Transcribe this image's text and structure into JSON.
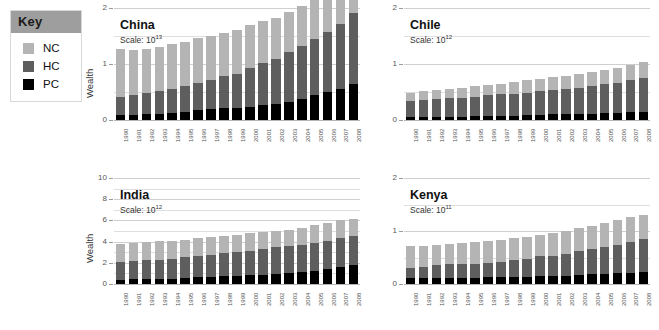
{
  "key": {
    "title": "Key",
    "items": [
      {
        "label": "NC",
        "color": "#b4b4b4"
      },
      {
        "label": "HC",
        "color": "#5e5e5e"
      },
      {
        "label": "PC",
        "color": "#000000"
      }
    ]
  },
  "colors": {
    "nc": "#b4b4b4",
    "hc": "#5e5e5e",
    "pc": "#000000",
    "grid": "#cfcfcf",
    "text": "#1a1a1a",
    "key_header_bg": "#9e9e9e"
  },
  "axis": {
    "ylabel": "Wealth",
    "scale_prefix": "Scale:",
    "scale_base": "10"
  },
  "years": [
    "1990",
    "1991",
    "1992",
    "1993",
    "1994",
    "1995",
    "1996",
    "1997",
    "1998",
    "1999",
    "2000",
    "2001",
    "2002",
    "2003",
    "2004",
    "2005",
    "2006",
    "2007",
    "2008"
  ],
  "chart_data": [
    {
      "type": "bar",
      "subtype": "stacked",
      "title": "China",
      "scale_exponent": "13",
      "xlabel": "",
      "ylabel": "Wealth",
      "ylim": [
        0,
        2
      ],
      "yticks": [
        0,
        1,
        2
      ],
      "grid": true,
      "legend": [
        "NC",
        "HC",
        "PC"
      ],
      "legend_position": "outside-top-left",
      "categories": [
        "1990",
        "1991",
        "1992",
        "1993",
        "1994",
        "1995",
        "1996",
        "1997",
        "1998",
        "1999",
        "2000",
        "2001",
        "2002",
        "2003",
        "2004",
        "2005",
        "2006",
        "2007",
        "2008"
      ],
      "series": [
        {
          "name": "PC",
          "values": [
            0.09,
            0.09,
            0.1,
            0.11,
            0.13,
            0.15,
            0.17,
            0.19,
            0.21,
            0.22,
            0.24,
            0.27,
            0.29,
            0.33,
            0.37,
            0.44,
            0.5,
            0.56,
            0.64
          ]
        },
        {
          "name": "HC",
          "values": [
            0.32,
            0.35,
            0.38,
            0.4,
            0.42,
            0.45,
            0.49,
            0.53,
            0.57,
            0.61,
            0.68,
            0.75,
            0.8,
            0.89,
            0.95,
            1.0,
            1.07,
            1.15,
            1.27
          ]
        },
        {
          "name": "NC",
          "values": [
            0.85,
            0.81,
            0.79,
            0.79,
            0.8,
            0.8,
            0.8,
            0.78,
            0.78,
            0.78,
            0.77,
            0.74,
            0.74,
            0.71,
            0.71,
            0.7,
            0.69,
            0.68,
            0.67
          ]
        }
      ],
      "totals": [
        1.26,
        1.25,
        1.27,
        1.3,
        1.35,
        1.4,
        1.46,
        1.5,
        1.56,
        1.61,
        1.69,
        1.76,
        1.83,
        1.93,
        2.03,
        2.14,
        2.26,
        2.39,
        2.58
      ]
    },
    {
      "type": "bar",
      "subtype": "stacked",
      "title": "Chile",
      "scale_exponent": "12",
      "xlabel": "",
      "ylabel": "",
      "ylim": [
        0,
        2
      ],
      "yticks": [
        0,
        1,
        2
      ],
      "grid": true,
      "legend": [
        "NC",
        "HC",
        "PC"
      ],
      "categories": [
        "1990",
        "1991",
        "1992",
        "1993",
        "1994",
        "1995",
        "1996",
        "1997",
        "1998",
        "1999",
        "2000",
        "2001",
        "2002",
        "2003",
        "2004",
        "2005",
        "2006",
        "2007",
        "2008"
      ],
      "series": [
        {
          "name": "PC",
          "values": [
            0.05,
            0.05,
            0.06,
            0.06,
            0.06,
            0.07,
            0.07,
            0.08,
            0.08,
            0.09,
            0.09,
            0.1,
            0.1,
            0.11,
            0.11,
            0.12,
            0.12,
            0.14,
            0.15
          ]
        },
        {
          "name": "HC",
          "values": [
            0.29,
            0.3,
            0.31,
            0.33,
            0.34,
            0.35,
            0.37,
            0.38,
            0.39,
            0.4,
            0.42,
            0.43,
            0.45,
            0.47,
            0.49,
            0.52,
            0.54,
            0.57,
            0.6
          ]
        },
        {
          "name": "NC",
          "values": [
            0.15,
            0.16,
            0.16,
            0.17,
            0.18,
            0.18,
            0.19,
            0.19,
            0.21,
            0.22,
            0.22,
            0.23,
            0.24,
            0.25,
            0.26,
            0.26,
            0.27,
            0.28,
            0.29
          ]
        }
      ],
      "totals": [
        0.49,
        0.51,
        0.53,
        0.56,
        0.58,
        0.6,
        0.63,
        0.65,
        0.68,
        0.71,
        0.73,
        0.76,
        0.79,
        0.83,
        0.86,
        0.9,
        0.93,
        0.99,
        1.04
      ]
    },
    {
      "type": "bar",
      "subtype": "stacked",
      "title": "India",
      "scale_exponent": "12",
      "xlabel": "",
      "ylabel": "Wealth",
      "ylim": [
        0,
        10
      ],
      "yticks": [
        0,
        2,
        4,
        6,
        8,
        10
      ],
      "grid": true,
      "legend": [
        "NC",
        "HC",
        "PC"
      ],
      "categories": [
        "1990",
        "1991",
        "1992",
        "1993",
        "1994",
        "1995",
        "1996",
        "1997",
        "1998",
        "1999",
        "2000",
        "2001",
        "2002",
        "2003",
        "2004",
        "2005",
        "2006",
        "2007",
        "2008"
      ],
      "series": [
        {
          "name": "PC",
          "values": [
            0.42,
            0.44,
            0.46,
            0.48,
            0.52,
            0.56,
            0.62,
            0.68,
            0.72,
            0.76,
            0.82,
            0.88,
            0.95,
            1.05,
            1.15,
            1.27,
            1.42,
            1.58,
            1.76
          ]
        },
        {
          "name": "HC",
          "values": [
            1.68,
            1.72,
            1.76,
            1.8,
            1.88,
            1.96,
            2.06,
            2.1,
            2.18,
            2.24,
            2.34,
            2.4,
            2.58,
            2.5,
            2.56,
            2.62,
            2.68,
            2.74,
            2.78
          ]
        },
        {
          "name": "NC",
          "values": [
            1.7,
            1.72,
            1.76,
            1.8,
            1.7,
            1.66,
            1.64,
            1.7,
            1.64,
            1.66,
            1.62,
            1.62,
            1.48,
            1.58,
            1.62,
            1.64,
            1.62,
            1.68,
            1.62
          ]
        }
      ],
      "totals": [
        3.8,
        3.88,
        3.98,
        4.08,
        4.1,
        4.18,
        4.32,
        4.48,
        4.54,
        4.66,
        4.78,
        4.9,
        5.01,
        5.13,
        5.33,
        5.53,
        5.72,
        6.0,
        6.16
      ]
    },
    {
      "type": "bar",
      "subtype": "stacked",
      "title": "Kenya",
      "scale_exponent": "11",
      "xlabel": "",
      "ylabel": "",
      "ylim": [
        0,
        2
      ],
      "yticks": [
        0,
        1,
        2
      ],
      "grid": true,
      "legend": [
        "NC",
        "HC",
        "PC"
      ],
      "categories": [
        "1990",
        "1991",
        "1992",
        "1993",
        "1994",
        "1995",
        "1996",
        "1997",
        "1998",
        "1999",
        "2000",
        "2001",
        "2002",
        "2003",
        "2004",
        "2005",
        "2006",
        "2007",
        "2008"
      ],
      "series": [
        {
          "name": "PC",
          "values": [
            0.12,
            0.12,
            0.12,
            0.12,
            0.12,
            0.12,
            0.13,
            0.13,
            0.14,
            0.14,
            0.15,
            0.15,
            0.16,
            0.17,
            0.18,
            0.19,
            0.2,
            0.21,
            0.22
          ]
        },
        {
          "name": "HC",
          "values": [
            0.18,
            0.21,
            0.24,
            0.26,
            0.25,
            0.26,
            0.27,
            0.28,
            0.32,
            0.33,
            0.37,
            0.38,
            0.41,
            0.45,
            0.48,
            0.51,
            0.54,
            0.59,
            0.63
          ]
        },
        {
          "name": "NC",
          "values": [
            0.41,
            0.38,
            0.38,
            0.38,
            0.4,
            0.41,
            0.42,
            0.42,
            0.4,
            0.42,
            0.41,
            0.43,
            0.43,
            0.43,
            0.44,
            0.45,
            0.46,
            0.46,
            0.46
          ]
        }
      ],
      "totals": [
        0.71,
        0.71,
        0.74,
        0.76,
        0.77,
        0.79,
        0.82,
        0.83,
        0.86,
        0.89,
        0.93,
        0.96,
        1.0,
        1.05,
        1.1,
        1.15,
        1.2,
        1.26,
        1.31
      ]
    }
  ]
}
